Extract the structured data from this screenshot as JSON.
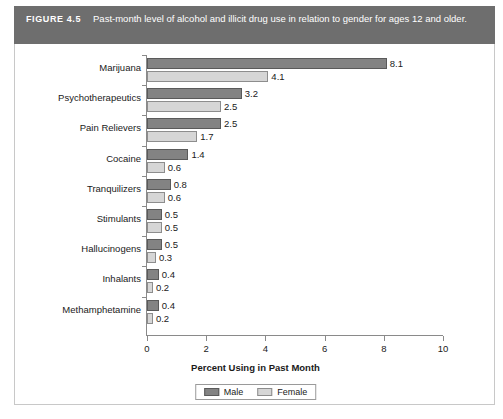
{
  "figure": {
    "label": "FIGURE 4.5",
    "caption": "Past-month level of alcohol and illicit drug use in relation to gender for ages 12 and older."
  },
  "chart_data": {
    "type": "bar",
    "orientation": "horizontal",
    "title": "Past-month level of alcohol and illicit drug use in relation to gender for ages 12 and older.",
    "xlabel": "Percent Using in Past Month",
    "ylabel": "",
    "xlim": [
      0,
      10
    ],
    "xticks": [
      0,
      2,
      4,
      6,
      8,
      10
    ],
    "grid": false,
    "legend_position": "bottom",
    "categories": [
      "Marijuana",
      "Psychotherapeutics",
      "Pain Relievers",
      "Cocaine",
      "Tranquilizers",
      "Stimulants",
      "Hallucinogens",
      "Inhalants",
      "Methamphetamine"
    ],
    "series": [
      {
        "name": "Male",
        "color": "#838383",
        "values": [
          8.1,
          3.2,
          2.5,
          1.4,
          0.8,
          0.5,
          0.5,
          0.4,
          0.4
        ]
      },
      {
        "name": "Female",
        "color": "#d6d6d6",
        "values": [
          4.1,
          2.5,
          1.7,
          0.6,
          0.6,
          0.5,
          0.3,
          0.2,
          0.2
        ]
      }
    ]
  },
  "colors": {
    "header_band": "#6e6e6e",
    "male_bar": "#838383",
    "female_bar": "#d6d6d6",
    "axis": "#8a8a8a",
    "panel_border": "#c8c8c8"
  }
}
